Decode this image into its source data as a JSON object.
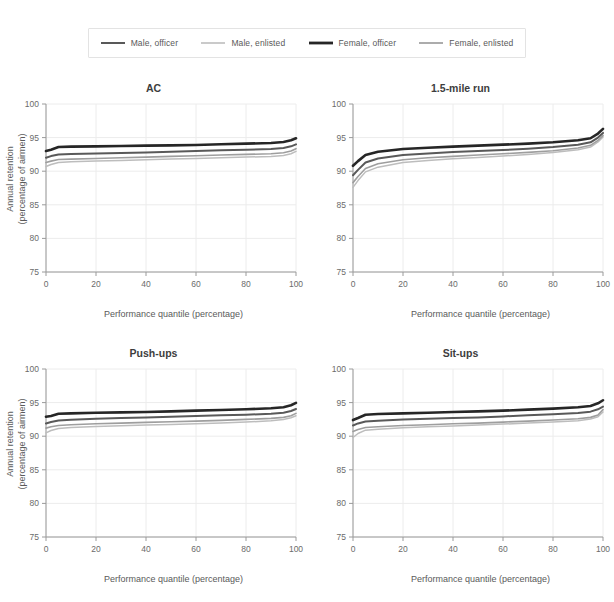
{
  "legend": {
    "position": "top-center",
    "items": [
      {
        "label": "Male, officer",
        "color": "#595959",
        "width": 2.0
      },
      {
        "label": "Male, enlisted",
        "color": "#bdbdbd",
        "width": 1.5
      },
      {
        "label": "Female, officer",
        "color": "#262626",
        "width": 2.6
      },
      {
        "label": "Female, enlisted",
        "color": "#9e9e9e",
        "width": 1.6
      }
    ]
  },
  "axis": {
    "xlabel": "Performance quantile (percentage)",
    "ylabel_line1": "Annual retention",
    "ylabel_line2": "(percentage of airmen)",
    "xticks": [
      "0",
      "20",
      "40",
      "60",
      "80",
      "100"
    ],
    "yticks": [
      "75",
      "80",
      "85",
      "90",
      "95",
      "100"
    ],
    "xlim": [
      0,
      100
    ],
    "ylim": [
      75,
      100
    ]
  },
  "chart_data": [
    {
      "type": "line",
      "title": "AC",
      "xlabel": "Performance quantile (percentage)",
      "ylabel": "Annual retention (percentage of airmen)",
      "xlim": [
        0,
        100
      ],
      "ylim": [
        75,
        100
      ],
      "grid": true,
      "legend": "top-center",
      "x": [
        0,
        2,
        5,
        10,
        20,
        30,
        40,
        50,
        60,
        70,
        80,
        90,
        95,
        98,
        100
      ],
      "series": [
        {
          "name": "Female, officer",
          "color": "#262626",
          "width": 2.6,
          "values": [
            93.0,
            93.2,
            93.6,
            93.65,
            93.7,
            93.75,
            93.8,
            93.85,
            93.9,
            94.0,
            94.1,
            94.2,
            94.35,
            94.6,
            94.9
          ]
        },
        {
          "name": "Male, officer",
          "color": "#595959",
          "width": 2.0,
          "values": [
            92.0,
            92.25,
            92.5,
            92.55,
            92.65,
            92.7,
            92.8,
            92.9,
            93.0,
            93.1,
            93.2,
            93.3,
            93.45,
            93.7,
            94.0
          ]
        },
        {
          "name": "Female, enlisted",
          "color": "#9e9e9e",
          "width": 1.6,
          "values": [
            91.3,
            91.5,
            91.75,
            91.8,
            91.9,
            92.0,
            92.1,
            92.2,
            92.3,
            92.4,
            92.5,
            92.6,
            92.75,
            93.0,
            93.35
          ]
        },
        {
          "name": "Male, enlisted",
          "color": "#bdbdbd",
          "width": 1.5,
          "values": [
            90.7,
            91.0,
            91.3,
            91.4,
            91.5,
            91.6,
            91.7,
            91.8,
            91.9,
            92.0,
            92.1,
            92.2,
            92.35,
            92.6,
            92.95
          ]
        }
      ]
    },
    {
      "type": "line",
      "title": "1.5-mile run",
      "xlabel": "Performance quantile (percentage)",
      "ylabel": "Annual retention (percentage of airmen)",
      "xlim": [
        0,
        100
      ],
      "ylim": [
        75,
        100
      ],
      "grid": true,
      "legend": "top-center",
      "x": [
        0,
        2,
        5,
        10,
        20,
        30,
        40,
        50,
        60,
        70,
        80,
        90,
        95,
        98,
        100
      ],
      "series": [
        {
          "name": "Female, officer",
          "color": "#262626",
          "width": 2.6,
          "values": [
            90.8,
            91.5,
            92.4,
            92.9,
            93.3,
            93.5,
            93.65,
            93.8,
            93.95,
            94.1,
            94.3,
            94.6,
            94.9,
            95.6,
            96.3
          ]
        },
        {
          "name": "Male, officer",
          "color": "#595959",
          "width": 2.0,
          "values": [
            89.4,
            90.2,
            91.3,
            91.9,
            92.4,
            92.65,
            92.85,
            93.0,
            93.15,
            93.35,
            93.6,
            93.95,
            94.3,
            95.0,
            95.7
          ]
        },
        {
          "name": "Female, enlisted",
          "color": "#9e9e9e",
          "width": 1.6,
          "values": [
            88.3,
            89.2,
            90.4,
            91.1,
            91.7,
            92.0,
            92.2,
            92.4,
            92.6,
            92.8,
            93.05,
            93.45,
            93.85,
            94.6,
            95.3
          ]
        },
        {
          "name": "Male, enlisted",
          "color": "#bdbdbd",
          "width": 1.5,
          "values": [
            87.6,
            88.6,
            89.9,
            90.6,
            91.3,
            91.6,
            91.85,
            92.05,
            92.25,
            92.5,
            92.8,
            93.2,
            93.6,
            94.35,
            95.1
          ]
        }
      ]
    },
    {
      "type": "line",
      "title": "Push-ups",
      "xlabel": "Performance quantile (percentage)",
      "ylabel": "Annual retention (percentage of airmen)",
      "xlim": [
        0,
        100
      ],
      "ylim": [
        75,
        100
      ],
      "grid": true,
      "legend": "top-center",
      "x": [
        0,
        2,
        5,
        10,
        20,
        30,
        40,
        50,
        60,
        70,
        80,
        90,
        95,
        98,
        100
      ],
      "series": [
        {
          "name": "Female, officer",
          "color": "#262626",
          "width": 2.6,
          "values": [
            92.9,
            93.0,
            93.35,
            93.4,
            93.5,
            93.55,
            93.6,
            93.7,
            93.8,
            93.9,
            94.0,
            94.15,
            94.3,
            94.6,
            94.95
          ]
        },
        {
          "name": "Male, officer",
          "color": "#595959",
          "width": 2.0,
          "values": [
            91.9,
            92.1,
            92.35,
            92.45,
            92.6,
            92.7,
            92.8,
            92.9,
            93.0,
            93.1,
            93.2,
            93.35,
            93.5,
            93.75,
            94.05
          ]
        },
        {
          "name": "Female, enlisted",
          "color": "#9e9e9e",
          "width": 1.6,
          "values": [
            91.2,
            91.4,
            91.6,
            91.7,
            91.85,
            91.95,
            92.05,
            92.15,
            92.25,
            92.35,
            92.5,
            92.65,
            92.8,
            93.05,
            93.4
          ]
        },
        {
          "name": "Male, enlisted",
          "color": "#bdbdbd",
          "width": 1.5,
          "values": [
            90.5,
            90.85,
            91.15,
            91.3,
            91.45,
            91.55,
            91.65,
            91.75,
            91.85,
            91.95,
            92.1,
            92.3,
            92.5,
            92.75,
            93.05
          ]
        }
      ]
    },
    {
      "type": "line",
      "title": "Sit-ups",
      "xlabel": "Performance quantile (percentage)",
      "ylabel": "Annual retention (percentage of airmen)",
      "xlim": [
        0,
        100
      ],
      "ylim": [
        75,
        100
      ],
      "grid": true,
      "legend": "top-center",
      "x": [
        0,
        2,
        5,
        10,
        20,
        30,
        40,
        50,
        60,
        70,
        80,
        90,
        95,
        98,
        100
      ],
      "series": [
        {
          "name": "Female, officer",
          "color": "#262626",
          "width": 2.6,
          "values": [
            92.4,
            92.7,
            93.2,
            93.3,
            93.4,
            93.5,
            93.6,
            93.7,
            93.8,
            93.95,
            94.1,
            94.3,
            94.5,
            94.9,
            95.35
          ]
        },
        {
          "name": "Male, officer",
          "color": "#595959",
          "width": 2.0,
          "values": [
            91.6,
            91.9,
            92.2,
            92.3,
            92.5,
            92.6,
            92.7,
            92.8,
            92.95,
            93.1,
            93.25,
            93.45,
            93.65,
            94.0,
            94.4
          ]
        },
        {
          "name": "Female, enlisted",
          "color": "#9e9e9e",
          "width": 1.6,
          "values": [
            90.7,
            91.0,
            91.3,
            91.4,
            91.6,
            91.7,
            91.85,
            91.95,
            92.1,
            92.25,
            92.4,
            92.6,
            92.8,
            93.15,
            93.95
          ]
        },
        {
          "name": "Male, enlisted",
          "color": "#bdbdbd",
          "width": 1.5,
          "values": [
            89.8,
            90.4,
            90.9,
            91.05,
            91.25,
            91.4,
            91.5,
            91.65,
            91.8,
            91.95,
            92.1,
            92.3,
            92.55,
            92.9,
            93.6
          ]
        }
      ]
    }
  ]
}
